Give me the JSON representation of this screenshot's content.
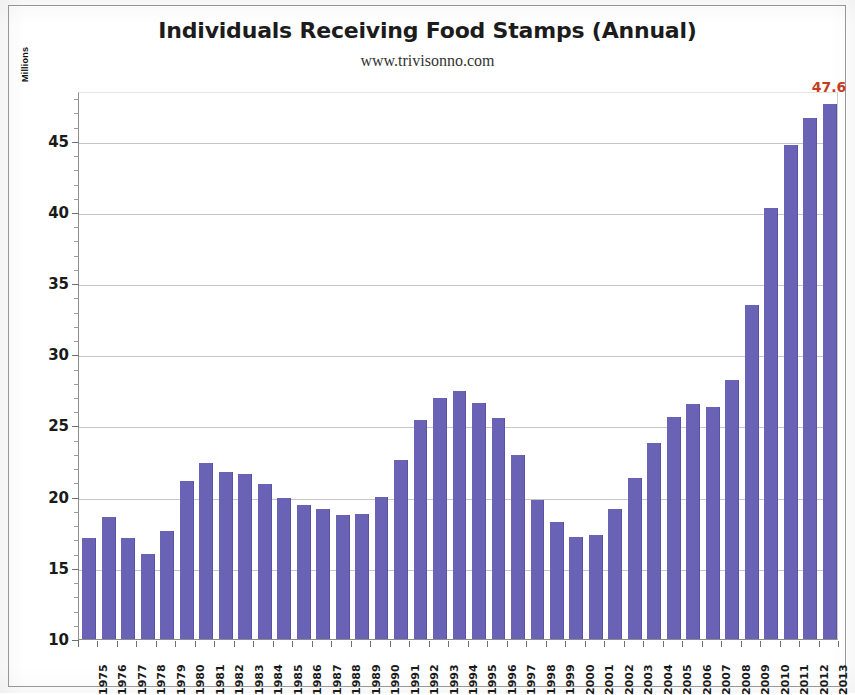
{
  "chart_data": {
    "type": "bar",
    "title": "Individuals Receiving Food Stamps (Annual)",
    "subtitle": "www.trivisonno.com",
    "xlabel": "",
    "ylabel": "Millions",
    "ylim": [
      10,
      48.5
    ],
    "yticks": [
      10,
      15,
      20,
      25,
      30,
      35,
      40,
      45
    ],
    "ytick_labels": [
      "10",
      "15",
      "20",
      "25",
      "30",
      "35",
      "40",
      "45"
    ],
    "grid": true,
    "legend": false,
    "bar_color": "#6a62b4",
    "annotation_color": "#c83c1e",
    "annotations": [
      {
        "label": "47.6",
        "category": "2013",
        "value": 47.6
      }
    ],
    "categories": [
      "1975",
      "1976",
      "1977",
      "1978",
      "1979",
      "1980",
      "1981",
      "1982",
      "1983",
      "1984",
      "1985",
      "1986",
      "1987",
      "1988",
      "1989",
      "1990",
      "1991",
      "1992",
      "1993",
      "1994",
      "1995",
      "1996",
      "1997",
      "1998",
      "1999",
      "2000",
      "2001",
      "2002",
      "2003",
      "2004",
      "2005",
      "2006",
      "2007",
      "2008",
      "2009",
      "2010",
      "2011",
      "2012",
      "2013"
    ],
    "values": [
      17.1,
      18.6,
      17.1,
      16.0,
      17.6,
      21.1,
      22.4,
      21.7,
      21.6,
      20.9,
      19.9,
      19.4,
      19.1,
      18.7,
      18.8,
      20.0,
      22.6,
      25.4,
      26.9,
      27.4,
      26.6,
      25.5,
      22.9,
      19.8,
      18.2,
      17.2,
      17.3,
      19.1,
      21.3,
      23.8,
      25.6,
      26.5,
      26.3,
      28.2,
      33.5,
      40.3,
      44.7,
      46.6,
      47.6
    ]
  },
  "axis": {
    "y_title": "Millions"
  }
}
